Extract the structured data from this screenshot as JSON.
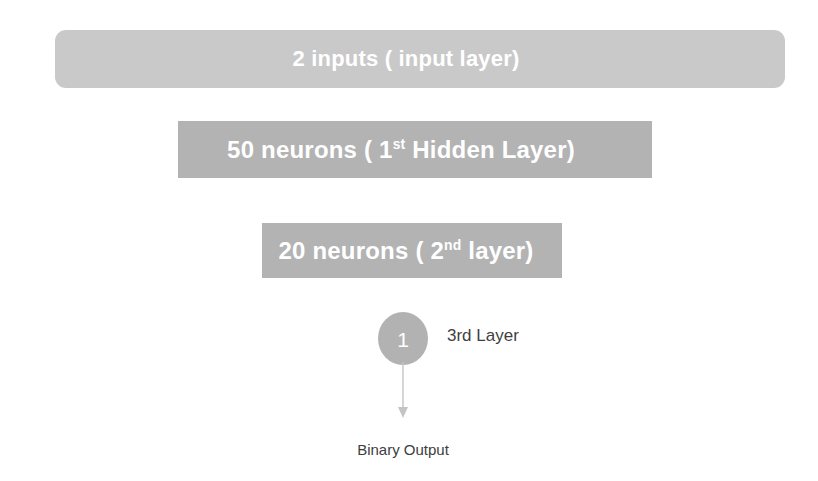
{
  "diagram": {
    "background_color": "#ffffff",
    "layers": [
      {
        "id": "input",
        "label_prefix": "2 inputs ( input layer)",
        "label_superscript": "",
        "label_suffix": "",
        "count": 2,
        "role": "input layer",
        "color": "#c9c9c9",
        "text_color": "#ffffff",
        "shape": "rounded-bar"
      },
      {
        "id": "hidden1",
        "label_prefix": "50 neurons ( 1",
        "label_superscript": "st",
        "label_suffix": " Hidden Layer)",
        "count": 50,
        "role": "1st Hidden Layer",
        "color": "#b3b3b3",
        "text_color": "#ffffff",
        "shape": "bar"
      },
      {
        "id": "hidden2",
        "label_prefix": "20 neurons ( 2",
        "label_superscript": "nd",
        "label_suffix": " layer)",
        "count": 20,
        "role": "2nd layer",
        "color": "#b3b3b3",
        "text_color": "#ffffff",
        "shape": "bar"
      }
    ],
    "output_node": {
      "value": "1",
      "color": "#b2b2b2",
      "text_color": "#ffffff",
      "side_label": "3rd Layer"
    },
    "arrow": {
      "icon": "arrow-down-icon",
      "color": "#c4c4c4"
    },
    "output_label": "Binary Output"
  }
}
